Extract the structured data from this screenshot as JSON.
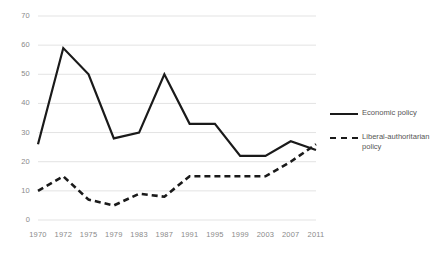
{
  "chart_data": {
    "type": "line",
    "title": "",
    "xlabel": "",
    "ylabel": "",
    "categories": [
      "1970",
      "1972",
      "1975",
      "1979",
      "1983",
      "1987",
      "1991",
      "1995",
      "1999",
      "2003",
      "2007",
      "2011"
    ],
    "ylim": [
      0,
      70
    ],
    "ytick_step": 10,
    "yticks": [
      "0",
      "10",
      "20",
      "30",
      "40",
      "50",
      "60",
      "70"
    ],
    "grid": true,
    "legend_position": "right",
    "series": [
      {
        "name": "Economic policy",
        "style": "solid",
        "color": "#1a1a1a",
        "values": [
          26,
          59,
          50,
          28,
          30,
          50,
          33,
          33,
          22,
          22,
          27,
          24
        ]
      },
      {
        "name": "Liberal-authoritarian policy",
        "style": "dashed",
        "color": "#1a1a1a",
        "values": [
          10,
          15,
          7,
          5,
          9,
          8,
          15,
          15,
          15,
          15,
          20,
          26
        ]
      }
    ]
  },
  "legend": {
    "items": [
      {
        "label": "Economic policy"
      },
      {
        "label": "Liberal-authoritarian policy"
      }
    ]
  }
}
